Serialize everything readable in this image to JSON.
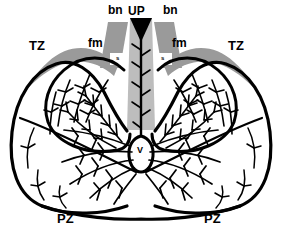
{
  "figure": {
    "background_color": "#ffffff",
    "ink_color": "#000000",
    "zone_gray_dark": "#999999",
    "zone_gray_light": "#bcbcbc"
  },
  "labels": {
    "bn_left": "bn",
    "bn_right": "bn",
    "up": "UP",
    "tz_left": "TZ",
    "tz_right": "TZ",
    "fm_left": "fm",
    "fm_right": "fm",
    "s_left": "s",
    "s_right": "s",
    "v": "V",
    "pz_left": "PZ",
    "pz_right": "PZ"
  }
}
